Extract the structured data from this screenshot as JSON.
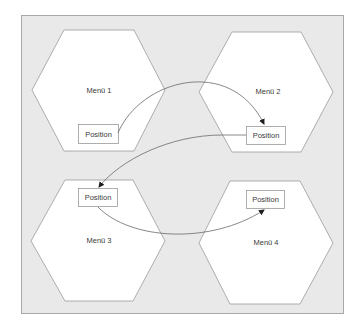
{
  "diagram": {
    "type": "menu-navigation-diagram",
    "background_color": "#e9e9e9",
    "panel_border_color": "#a8a8a8",
    "shape_fill": "#ffffff",
    "shape_stroke": "#9a9a9a",
    "arrow_color": "#6a6a6a",
    "text_color": "#3a3a3a",
    "nodes": [
      {
        "id": "menu1",
        "label": "Menü 1",
        "position_label": "Position"
      },
      {
        "id": "menu2",
        "label": "Menü 2",
        "position_label": "Position"
      },
      {
        "id": "menu3",
        "label": "Menü 3",
        "position_label": "Position"
      },
      {
        "id": "menu4",
        "label": "Menü 4",
        "position_label": "Position"
      }
    ],
    "edges": [
      {
        "from": "menu1.position",
        "to": "menu2.position"
      },
      {
        "from": "menu2.position",
        "to": "menu3.position"
      },
      {
        "from": "menu3.position",
        "to": "menu4.position"
      }
    ]
  }
}
